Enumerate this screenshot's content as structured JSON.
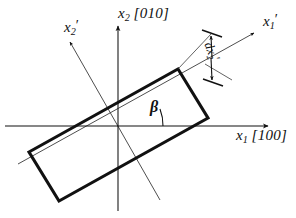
{
  "figure": {
    "background_color": "#ffffff",
    "line_color": "#111111",
    "thin_line_color": "#555555"
  },
  "axes": {
    "x1": {
      "symbol": "x",
      "subscript": "1",
      "miller": "[100]",
      "label": "x1 [100]",
      "name": "x1-axis",
      "direction": "horizontal-right"
    },
    "x2": {
      "symbol": "x",
      "subscript": "2",
      "miller": "[010]",
      "label": "x2 [010]",
      "name": "x2-axis",
      "direction": "vertical-up"
    },
    "x1_prime": {
      "symbol": "x",
      "subscript": "1",
      "prime": "′",
      "label": "x1′",
      "name": "x1-prime-axis",
      "direction": "rotated-up-right"
    },
    "x2_prime": {
      "symbol": "x",
      "subscript": "2",
      "prime": "′",
      "label": "x2′",
      "name": "x2-prime-axis",
      "direction": "rotated-up-left"
    }
  },
  "annotations": {
    "angle": {
      "symbol": "β",
      "name": "beta-angle-label",
      "description": "rotation angle between x1 and x1 prime"
    },
    "dimension": {
      "symbol": "d",
      "variable": "x",
      "subscript": "2",
      "prime": "′",
      "label": "dx2′",
      "name": "dx2-prime-dimension-label",
      "description": "width of the slab measured along x2 prime"
    }
  },
  "shape": {
    "name": "rotated-rectangle",
    "description": "bold outlined rectangular slab rotated by beta"
  }
}
